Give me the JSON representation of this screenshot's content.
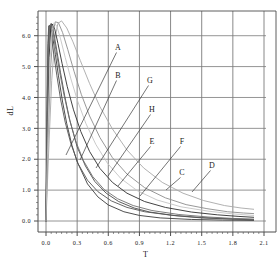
{
  "chart_data": {
    "type": "line",
    "title": "",
    "xlabel": "T",
    "ylabel": "dL",
    "xlim": [
      0.0,
      2.1
    ],
    "ylim": [
      0.0,
      6.8
    ],
    "xticks": [
      "0.0",
      "0.3",
      "0.6",
      "0.9",
      "1.2",
      "1.5",
      "1.8",
      "2.1"
    ],
    "xtick_values": [
      0.0,
      0.3,
      0.6,
      0.9,
      1.2,
      1.5,
      1.8,
      2.1
    ],
    "yticks": [
      "0.0",
      "1.0",
      "2.0",
      "3.0",
      "4.0",
      "5.0",
      "6.0"
    ],
    "ytick_values": [
      0.0,
      1.0,
      2.0,
      3.0,
      4.0,
      5.0,
      6.0
    ],
    "grid": true,
    "legend_position": "inline-callouts",
    "series": [
      {
        "name": "A",
        "color": "#3a3a3a",
        "label_x": 118,
        "label_y": 50,
        "leader_to_x": 66,
        "leader_to_y": 155,
        "points": [
          [
            0.0,
            0.0
          ],
          [
            0.01,
            3.4
          ],
          [
            0.02,
            5.6
          ],
          [
            0.03,
            6.3
          ],
          [
            0.04,
            6.35
          ],
          [
            0.06,
            6.05
          ],
          [
            0.09,
            5.4
          ],
          [
            0.12,
            4.7
          ],
          [
            0.16,
            3.85
          ],
          [
            0.2,
            3.15
          ],
          [
            0.25,
            2.45
          ],
          [
            0.3,
            1.92
          ],
          [
            0.4,
            1.2
          ],
          [
            0.5,
            0.78
          ],
          [
            0.6,
            0.52
          ],
          [
            0.75,
            0.3
          ],
          [
            0.9,
            0.18
          ],
          [
            1.1,
            0.1
          ],
          [
            1.4,
            0.05
          ],
          [
            1.7,
            0.03
          ],
          [
            2.0,
            0.02
          ]
        ]
      },
      {
        "name": "B",
        "color": "#4a4a4a",
        "label_x": 118,
        "label_y": 78,
        "leader_to_x": 80,
        "leader_to_y": 160,
        "points": [
          [
            0.0,
            0.0
          ],
          [
            0.012,
            3.1
          ],
          [
            0.025,
            5.45
          ],
          [
            0.035,
            6.28
          ],
          [
            0.05,
            6.4
          ],
          [
            0.07,
            6.18
          ],
          [
            0.1,
            5.6
          ],
          [
            0.14,
            4.8
          ],
          [
            0.18,
            4.05
          ],
          [
            0.23,
            3.25
          ],
          [
            0.3,
            2.4
          ],
          [
            0.38,
            1.78
          ],
          [
            0.47,
            1.28
          ],
          [
            0.58,
            0.9
          ],
          [
            0.7,
            0.63
          ],
          [
            0.85,
            0.42
          ],
          [
            1.0,
            0.29
          ],
          [
            1.25,
            0.17
          ],
          [
            1.5,
            0.1
          ],
          [
            1.8,
            0.06
          ],
          [
            2.0,
            0.04
          ]
        ]
      },
      {
        "name": "C",
        "color": "#8c8c8c",
        "label_x": 182,
        "label_y": 175,
        "leader_to_x": 166,
        "leader_to_y": 190,
        "points": [
          [
            0.0,
            0.0
          ],
          [
            0.02,
            2.6
          ],
          [
            0.045,
            5.0
          ],
          [
            0.07,
            6.15
          ],
          [
            0.09,
            6.45
          ],
          [
            0.12,
            6.42
          ],
          [
            0.16,
            6.1
          ],
          [
            0.21,
            5.55
          ],
          [
            0.27,
            4.85
          ],
          [
            0.34,
            4.1
          ],
          [
            0.42,
            3.4
          ],
          [
            0.52,
            2.7
          ],
          [
            0.64,
            2.05
          ],
          [
            0.78,
            1.52
          ],
          [
            0.95,
            1.08
          ],
          [
            1.15,
            0.75
          ],
          [
            1.35,
            0.53
          ],
          [
            1.55,
            0.4
          ],
          [
            1.75,
            0.3
          ],
          [
            1.9,
            0.26
          ],
          [
            2.0,
            0.24
          ]
        ]
      },
      {
        "name": "D",
        "color": "#a8a8a8",
        "label_x": 212,
        "label_y": 168,
        "leader_to_x": 192,
        "leader_to_y": 192,
        "points": [
          [
            0.0,
            0.0
          ],
          [
            0.025,
            2.2
          ],
          [
            0.055,
            4.55
          ],
          [
            0.085,
            5.9
          ],
          [
            0.115,
            6.4
          ],
          [
            0.15,
            6.48
          ],
          [
            0.2,
            6.25
          ],
          [
            0.26,
            5.8
          ],
          [
            0.33,
            5.2
          ],
          [
            0.42,
            4.45
          ],
          [
            0.52,
            3.7
          ],
          [
            0.64,
            2.98
          ],
          [
            0.78,
            2.3
          ],
          [
            0.94,
            1.72
          ],
          [
            1.12,
            1.25
          ],
          [
            1.32,
            0.9
          ],
          [
            1.52,
            0.66
          ],
          [
            1.72,
            0.5
          ],
          [
            1.88,
            0.42
          ],
          [
            2.0,
            0.38
          ]
        ]
      },
      {
        "name": "E",
        "color": "#555555",
        "label_x": 152,
        "label_y": 144,
        "leader_to_x": 118,
        "leader_to_y": 186,
        "points": [
          [
            0.0,
            0.0
          ],
          [
            0.01,
            3.6
          ],
          [
            0.018,
            5.75
          ],
          [
            0.026,
            6.32
          ],
          [
            0.035,
            6.3
          ],
          [
            0.05,
            6.0
          ],
          [
            0.075,
            5.4
          ],
          [
            0.105,
            4.7
          ],
          [
            0.14,
            3.95
          ],
          [
            0.185,
            3.2
          ],
          [
            0.24,
            2.5
          ],
          [
            0.31,
            1.85
          ],
          [
            0.4,
            1.32
          ],
          [
            0.5,
            0.95
          ],
          [
            0.63,
            0.65
          ],
          [
            0.78,
            0.44
          ],
          [
            0.95,
            0.3
          ],
          [
            1.2,
            0.19
          ],
          [
            1.5,
            0.11
          ],
          [
            1.8,
            0.07
          ],
          [
            2.0,
            0.05
          ]
        ]
      },
      {
        "name": "F",
        "color": "#2e2e2e",
        "label_x": 182,
        "label_y": 144,
        "leader_to_x": 140,
        "leader_to_y": 196,
        "points": [
          [
            0.0,
            0.0
          ],
          [
            0.015,
            2.95
          ],
          [
            0.03,
            5.3
          ],
          [
            0.045,
            6.22
          ],
          [
            0.06,
            6.38
          ],
          [
            0.085,
            6.2
          ],
          [
            0.115,
            5.75
          ],
          [
            0.155,
            5.1
          ],
          [
            0.205,
            4.35
          ],
          [
            0.265,
            3.6
          ],
          [
            0.335,
            2.9
          ],
          [
            0.42,
            2.25
          ],
          [
            0.52,
            1.7
          ],
          [
            0.64,
            1.25
          ],
          [
            0.78,
            0.9
          ],
          [
            0.95,
            0.63
          ],
          [
            1.15,
            0.44
          ],
          [
            1.4,
            0.29
          ],
          [
            1.65,
            0.2
          ],
          [
            1.85,
            0.15
          ],
          [
            2.0,
            0.12
          ]
        ]
      },
      {
        "name": "G",
        "color": "#6e6e6e",
        "label_x": 150,
        "label_y": 83,
        "leader_to_x": 96,
        "leader_to_y": 168,
        "points": [
          [
            0.0,
            0.0
          ],
          [
            0.012,
            3.25
          ],
          [
            0.024,
            5.5
          ],
          [
            0.036,
            6.28
          ],
          [
            0.048,
            6.36
          ],
          [
            0.068,
            6.12
          ],
          [
            0.095,
            5.55
          ],
          [
            0.13,
            4.85
          ],
          [
            0.172,
            4.1
          ],
          [
            0.222,
            3.35
          ],
          [
            0.285,
            2.6
          ],
          [
            0.36,
            1.96
          ],
          [
            0.45,
            1.44
          ],
          [
            0.56,
            1.02
          ],
          [
            0.69,
            0.72
          ],
          [
            0.84,
            0.5
          ],
          [
            1.02,
            0.34
          ],
          [
            1.28,
            0.21
          ],
          [
            1.56,
            0.13
          ],
          [
            1.82,
            0.08
          ],
          [
            2.0,
            0.06
          ]
        ]
      },
      {
        "name": "H",
        "color": "#c4c4c4",
        "label_x": 152,
        "label_y": 112,
        "leader_to_x": 108,
        "leader_to_y": 176,
        "points": [
          [
            0.0,
            0.0
          ],
          [
            0.018,
            2.75
          ],
          [
            0.038,
            5.15
          ],
          [
            0.058,
            6.18
          ],
          [
            0.078,
            6.42
          ],
          [
            0.105,
            6.3
          ],
          [
            0.14,
            5.9
          ],
          [
            0.185,
            5.3
          ],
          [
            0.24,
            4.6
          ],
          [
            0.305,
            3.88
          ],
          [
            0.385,
            3.15
          ],
          [
            0.48,
            2.48
          ],
          [
            0.59,
            1.88
          ],
          [
            0.72,
            1.38
          ],
          [
            0.88,
            0.98
          ],
          [
            1.07,
            0.68
          ],
          [
            1.3,
            0.46
          ],
          [
            1.56,
            0.32
          ],
          [
            1.8,
            0.23
          ],
          [
            2.0,
            0.18
          ]
        ]
      }
    ]
  },
  "style": {
    "frame_color": "#4d4d4d",
    "grid_color": "#7a7a7a",
    "tick_color": "#4d4d4d",
    "text_color": "#1a1a1a",
    "background": "#ffffff"
  }
}
